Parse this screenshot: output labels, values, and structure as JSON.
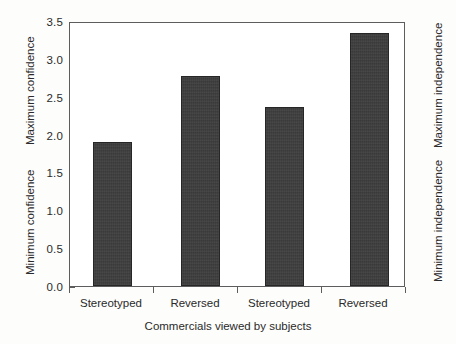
{
  "chart_data": {
    "type": "bar",
    "title": "",
    "categories": [
      "Stereotyped",
      "Reversed",
      "Stereotyped",
      "Reversed"
    ],
    "values": [
      1.91,
      2.8,
      2.38,
      3.37
    ],
    "xlabel": "Commercials viewed by subjects",
    "ylabel": "",
    "ylim": [
      0.0,
      3.5
    ],
    "yticks": [
      "0.0",
      "0.5",
      "1.0",
      "1.5",
      "2.0",
      "2.5",
      "3.0",
      "3.5"
    ],
    "ytick_values": [
      0.0,
      0.5,
      1.0,
      1.5,
      2.0,
      2.5,
      3.0,
      3.5
    ],
    "grid": false,
    "legend": false,
    "bar_color": "#3b3b3b",
    "axis_color": "#5d5d5d",
    "left_axis_annotations": {
      "top": "Maximum confidence",
      "bottom": "Minimum confidence"
    },
    "right_axis_annotations": {
      "top": "Maximum independence",
      "bottom": "Minimum independence"
    }
  }
}
